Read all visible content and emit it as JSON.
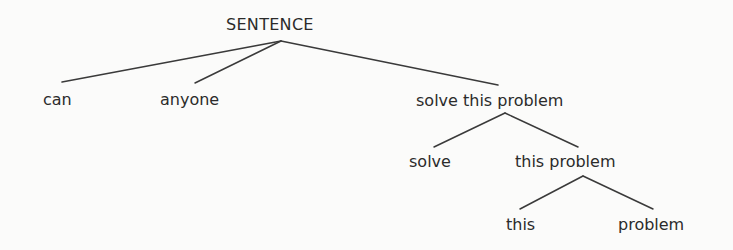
{
  "diagram": {
    "type": "constituency-tree",
    "line_color": "#3a3a3a",
    "text_color": "#2b2b2b",
    "background": "#fbfbfa",
    "nodes": {
      "root": {
        "label": "SENTENCE",
        "x": 226,
        "y": 17
      },
      "can": {
        "label": "can",
        "x": 43,
        "y": 92
      },
      "anyone": {
        "label": "anyone",
        "x": 160,
        "y": 92
      },
      "vp": {
        "label": "solve this problem",
        "x": 416,
        "y": 93
      },
      "solve": {
        "label": "solve",
        "x": 409,
        "y": 154
      },
      "np": {
        "label": "this problem",
        "x": 515,
        "y": 154
      },
      "this": {
        "label": "this",
        "x": 506,
        "y": 217
      },
      "problem": {
        "label": "problem",
        "x": 618,
        "y": 217
      }
    },
    "edges": [
      {
        "from": "root",
        "to": "can",
        "x1": 281,
        "y1": 41,
        "x2": 62,
        "y2": 82
      },
      {
        "from": "root",
        "to": "anyone",
        "x1": 281,
        "y1": 41,
        "x2": 195,
        "y2": 83
      },
      {
        "from": "root",
        "to": "vp",
        "x1": 281,
        "y1": 41,
        "x2": 498,
        "y2": 85
      },
      {
        "from": "vp",
        "to": "solve",
        "x1": 505,
        "y1": 113,
        "x2": 434,
        "y2": 147
      },
      {
        "from": "vp",
        "to": "np",
        "x1": 505,
        "y1": 113,
        "x2": 578,
        "y2": 147
      },
      {
        "from": "np",
        "to": "this",
        "x1": 583,
        "y1": 176,
        "x2": 520,
        "y2": 209
      },
      {
        "from": "np",
        "to": "problem",
        "x1": 583,
        "y1": 176,
        "x2": 653,
        "y2": 209
      }
    ]
  }
}
